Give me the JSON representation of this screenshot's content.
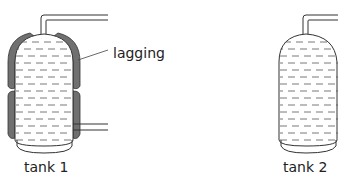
{
  "diagram": {
    "type": "comparison of water tanks",
    "labels": {
      "lagging": "lagging",
      "tank1": "tank 1",
      "tank2": "tank 2"
    },
    "colors": {
      "outline": "#333333",
      "lagging": "#707070",
      "liquid_dash": "#555555",
      "background": "#ffffff"
    },
    "tanks": [
      {
        "name": "tank 1",
        "lagged": true,
        "pipes": [
          "top outlet",
          "bottom side inlet"
        ]
      },
      {
        "name": "tank 2",
        "lagged": false,
        "pipes": [
          "top outlet"
        ]
      }
    ]
  }
}
